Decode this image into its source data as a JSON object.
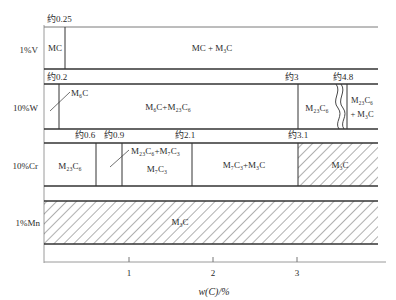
{
  "diagram": {
    "xaxis": {
      "label": "w(C)/%",
      "ticks": [
        "1",
        "2",
        "3"
      ]
    },
    "rows": [
      {
        "label": "1%V",
        "boundaries": [
          "约0.25"
        ],
        "phases": [
          "MC",
          "MC + M₃C"
        ]
      },
      {
        "label": "10%W",
        "boundaries": [
          "约0.2",
          "约3",
          "约4.8"
        ],
        "phases": [
          "M₆C",
          "M₆C+M₂₃C₆",
          "M₂₃C₆",
          "M₂₃C₆",
          "+ M₃C"
        ]
      },
      {
        "label": "10%Cr",
        "boundaries": [
          "约0.6",
          "约0.9",
          "约2.1",
          "约3.1"
        ],
        "phases": [
          "M₂₃C₆",
          "M₂₃C₆+M₇C₃",
          "M₇C₃",
          "M₇C₃+M₃C",
          "M₃C"
        ]
      },
      {
        "label": "1%Mn",
        "boundaries": [],
        "phases": [
          "M₃C"
        ]
      }
    ]
  }
}
